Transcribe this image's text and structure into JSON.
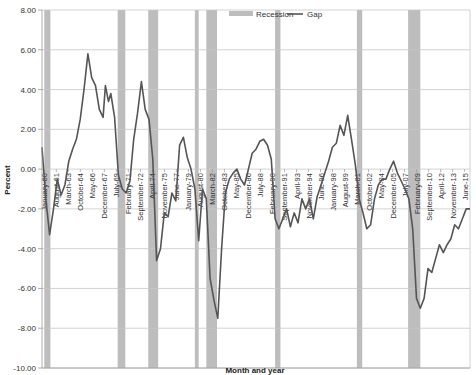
{
  "chart_data": {
    "type": "line",
    "title": "",
    "xlabel": "Month and year",
    "ylabel": "Percent",
    "ylim": [
      -10,
      8
    ],
    "y_ticks": [
      "8.00",
      "6.00",
      "4.00",
      "2.00",
      "0.00",
      "-2.00",
      "-4.00",
      "-6.00",
      "-8.00",
      "-10.00"
    ],
    "x_tick_labels": [
      "January-60",
      "August-61",
      "March-63",
      "October-64",
      "May-66",
      "December-67",
      "July-69",
      "February-71",
      "September-72",
      "April-74",
      "November-75",
      "June-77",
      "January-79",
      "August-80",
      "March-82",
      "October-83",
      "May-85",
      "December-86",
      "July-88",
      "February-90",
      "September-91",
      "April-93",
      "November-94",
      "June-96",
      "January-98",
      "August-99",
      "March-01",
      "October-02",
      "May-04",
      "December-05",
      "July-07",
      "February-09",
      "September-10",
      "April-12",
      "November-13",
      "June-15"
    ],
    "grid": true,
    "legend": {
      "position": "top",
      "entries": [
        "Recession",
        "Gap"
      ]
    },
    "recessions": [
      {
        "start": 1960.3,
        "end": 1961.1
      },
      {
        "start": 1969.9,
        "end": 1970.9
      },
      {
        "start": 1973.9,
        "end": 1975.2
      },
      {
        "start": 1980.0,
        "end": 1980.5
      },
      {
        "start": 1981.5,
        "end": 1982.9
      },
      {
        "start": 1990.5,
        "end": 1991.2
      },
      {
        "start": 2001.2,
        "end": 2001.9
      },
      {
        "start": 2007.9,
        "end": 2009.5
      }
    ],
    "series": [
      {
        "name": "Gap",
        "x": [
          1960.0,
          1960.5,
          1961.0,
          1961.5,
          1962.0,
          1962.5,
          1963.0,
          1963.5,
          1964.0,
          1964.5,
          1965.0,
          1965.5,
          1966.0,
          1966.5,
          1967.0,
          1967.5,
          1968.0,
          1968.3,
          1968.7,
          1969.0,
          1969.5,
          1970.0,
          1970.5,
          1971.0,
          1971.5,
          1972.0,
          1972.5,
          1973.0,
          1973.5,
          1974.0,
          1974.5,
          1975.0,
          1975.5,
          1976.0,
          1976.5,
          1977.0,
          1977.5,
          1978.0,
          1978.5,
          1979.0,
          1979.5,
          1980.0,
          1980.5,
          1981.0,
          1981.5,
          1982.0,
          1982.5,
          1983.0,
          1983.5,
          1984.0,
          1984.5,
          1985.0,
          1985.5,
          1986.0,
          1986.5,
          1987.0,
          1987.5,
          1988.0,
          1988.5,
          1989.0,
          1989.5,
          1990.0,
          1990.5,
          1991.0,
          1991.5,
          1992.0,
          1992.5,
          1993.0,
          1993.5,
          1994.0,
          1994.5,
          1995.0,
          1995.5,
          1996.0,
          1996.5,
          1997.0,
          1997.5,
          1998.0,
          1998.5,
          1999.0,
          1999.5,
          2000.0,
          2000.5,
          2001.0,
          2001.5,
          2002.0,
          2002.5,
          2003.0,
          2003.5,
          2004.0,
          2004.5,
          2005.0,
          2005.5,
          2006.0,
          2006.5,
          2007.0,
          2007.5,
          2008.0,
          2008.5,
          2009.0,
          2009.5,
          2010.0,
          2010.5,
          2011.0,
          2011.5,
          2012.0,
          2012.5,
          2013.0,
          2013.5,
          2014.0,
          2014.5,
          2015.0,
          2015.5,
          2016.0
        ],
        "values": [
          1.1,
          -1.5,
          -3.3,
          -2.0,
          -0.5,
          -1.3,
          -0.8,
          0.4,
          1.0,
          1.5,
          2.5,
          4.0,
          5.8,
          4.6,
          4.2,
          3.0,
          2.6,
          4.2,
          3.4,
          3.8,
          2.6,
          -0.3,
          -1.0,
          -1.2,
          -0.6,
          1.5,
          2.8,
          4.4,
          3.0,
          2.5,
          0.5,
          -4.6,
          -4.0,
          -2.2,
          -2.4,
          -1.2,
          -1.6,
          1.2,
          1.6,
          0.6,
          0.0,
          -1.0,
          -3.6,
          -1.0,
          -1.5,
          -5.5,
          -6.6,
          -7.5,
          -4.0,
          -1.2,
          -0.5,
          -0.2,
          0.0,
          -0.5,
          -0.8,
          0.0,
          0.8,
          1.0,
          1.4,
          1.5,
          1.2,
          0.5,
          -2.5,
          -3.0,
          -2.5,
          -2.0,
          -2.9,
          -2.2,
          -2.7,
          -1.5,
          -2.0,
          -1.5,
          -2.5,
          -1.4,
          -0.8,
          -0.2,
          0.4,
          1.1,
          1.3,
          2.2,
          1.7,
          2.7,
          1.5,
          0.2,
          -1.5,
          -2.2,
          -3.0,
          -2.8,
          -1.5,
          -0.8,
          -0.5,
          -0.5,
          0.0,
          0.4,
          -0.2,
          -0.6,
          -1.0,
          -1.5,
          -3.0,
          -6.5,
          -7.0,
          -6.5,
          -5.0,
          -5.2,
          -4.5,
          -3.8,
          -4.2,
          -3.8,
          -3.5,
          -2.8,
          -3.0,
          -2.5,
          -2.0,
          -2.0
        ]
      }
    ]
  },
  "colors": {
    "line": "#555555",
    "recession": "#bdbdbd",
    "grid": "#c8c8c8",
    "axis": "#999999"
  }
}
